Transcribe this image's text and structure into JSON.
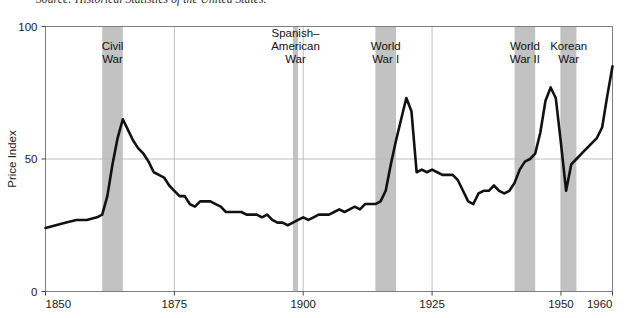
{
  "figure": {
    "source_note": "Source: Historical Statistics of the United States.",
    "background_color": "#ffffff"
  },
  "chart_data": {
    "type": "line",
    "title": "",
    "subtitle": "",
    "xlabel": "",
    "ylabel": "Price Index",
    "xlim": [
      1850,
      1960
    ],
    "ylim": [
      0,
      100
    ],
    "grid": true,
    "grid_color": "#b9b9b9",
    "legend_position": "none",
    "line_color": "#111111",
    "line_width": 2.6,
    "x_ticks": [
      1850,
      1875,
      1900,
      1925,
      1950,
      1960
    ],
    "x_tick_labels": [
      "1850",
      "1875",
      "1900",
      "1925",
      "1950",
      "1960"
    ],
    "y_ticks": [
      0,
      50,
      100
    ],
    "y_tick_labels": [
      "0",
      "50",
      "100"
    ],
    "annotations": [
      {
        "label": "Civil\nWar",
        "label_lines": [
          "Civil",
          "War"
        ],
        "x_start": 1861,
        "x_end": 1865,
        "color": "#c2c2c2"
      },
      {
        "label": "Spanish-American War",
        "label_lines": [
          "Spanish–",
          "American",
          "War"
        ],
        "x_start": 1898,
        "x_end": 1899,
        "color": "#c2c2c2"
      },
      {
        "label": "World War I",
        "label_lines": [
          "World",
          "War I"
        ],
        "x_start": 1914,
        "x_end": 1918,
        "color": "#c2c2c2"
      },
      {
        "label": "World War II",
        "label_lines": [
          "World",
          "War II"
        ],
        "x_start": 1941,
        "x_end": 1945,
        "color": "#c2c2c2"
      },
      {
        "label": "Korean War",
        "label_lines": [
          "Korean",
          "War"
        ],
        "x_start": 1950,
        "x_end": 1953,
        "color": "#c2c2c2"
      }
    ],
    "series": [
      {
        "name": "Price Index",
        "x": [
          1850,
          1852,
          1854,
          1856,
          1858,
          1860,
          1861,
          1862,
          1863,
          1864,
          1865,
          1866,
          1867,
          1868,
          1869,
          1870,
          1871,
          1872,
          1873,
          1874,
          1875,
          1876,
          1877,
          1878,
          1879,
          1880,
          1881,
          1882,
          1883,
          1884,
          1885,
          1886,
          1887,
          1888,
          1889,
          1890,
          1891,
          1892,
          1893,
          1894,
          1895,
          1896,
          1897,
          1898,
          1899,
          1900,
          1901,
          1902,
          1903,
          1904,
          1905,
          1906,
          1907,
          1908,
          1909,
          1910,
          1911,
          1912,
          1913,
          1914,
          1915,
          1916,
          1917,
          1918,
          1919,
          1920,
          1921,
          1922,
          1923,
          1924,
          1925,
          1926,
          1927,
          1928,
          1929,
          1930,
          1931,
          1932,
          1933,
          1934,
          1935,
          1936,
          1937,
          1938,
          1939,
          1940,
          1941,
          1942,
          1943,
          1944,
          1945,
          1946,
          1947,
          1948,
          1949,
          1950,
          1951,
          1952,
          1953,
          1954,
          1955,
          1956,
          1957,
          1958,
          1959,
          1960
        ],
        "values": [
          24,
          25,
          26,
          27,
          27,
          28,
          29,
          36,
          48,
          58,
          65,
          61,
          57,
          54,
          52,
          49,
          45,
          44,
          43,
          40,
          38,
          36,
          36,
          33,
          32,
          34,
          34,
          34,
          33,
          32,
          30,
          30,
          30,
          30,
          29,
          29,
          29,
          28,
          29,
          27,
          26,
          26,
          25,
          26,
          27,
          28,
          27,
          28,
          29,
          29,
          29,
          30,
          31,
          30,
          31,
          32,
          31,
          33,
          33,
          33,
          34,
          38,
          48,
          57,
          65,
          73,
          68,
          45,
          46,
          45,
          46,
          45,
          44,
          44,
          44,
          42,
          38,
          34,
          33,
          37,
          38,
          38,
          40,
          38,
          37,
          38,
          41,
          46,
          49,
          50,
          52,
          60,
          72,
          77,
          73,
          56,
          38,
          48,
          50,
          52,
          54,
          56,
          58,
          62,
          74,
          85
        ]
      }
    ]
  },
  "axes": {
    "y_axis_title": "Price Index"
  }
}
